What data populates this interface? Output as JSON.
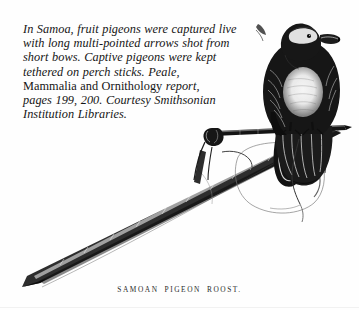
{
  "page": {
    "background_color": "#fefefe",
    "ink_color": "#151515",
    "width": 359,
    "height": 310
  },
  "caption": {
    "lines": [
      "In Samoa, fruit pigeons were captured live",
      "with long multi-pointed arrows shot from",
      "short bows. Captive pigeons were kept",
      "tethered on perch sticks. Peale,",
      "Mammalia and Ornithology report,",
      "pages 199, 200. Courtesy Smithsonian",
      "Institution Libraries."
    ],
    "line_5_roman_part": "Mammalia and Ornithology",
    "line_5_italic_part": " report,",
    "full_text": "In Samoa, fruit pigeons were captured live with long multi-pointed arrows shot from short bows. Captive pigeons were kept tethered on perch sticks. Peale, Mammalia and Ornithology report, pages 199, 200. Courtesy Smithsonian Institution Libraries."
  },
  "plate": {
    "title": "SAMOAN PIGEON ROOST.",
    "subject": "samoan-pigeon-roost-engraving",
    "elements": {
      "bird": "fruit-pigeon",
      "perch": "horizontal-perch-stick",
      "pole": "long-tapered-pole",
      "gourd": "hanging-gourd-pouch",
      "tether": "tether-cord"
    }
  }
}
